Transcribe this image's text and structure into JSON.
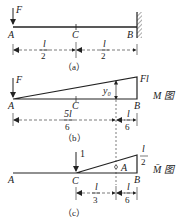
{
  "panel_a": {
    "force_label": "F",
    "points": [
      "A",
      "C",
      "B"
    ],
    "dims": [
      {
        "num": "l",
        "den": "2"
      },
      {
        "num": "l",
        "den": "2"
      }
    ],
    "caption": "（a）"
  },
  "panel_b": {
    "force_label": "F",
    "end_value": "Fl",
    "ordinate_label": "y₀",
    "diagram_label": "M 图",
    "points": [
      "A",
      "C",
      "B"
    ],
    "dims": [
      {
        "num": "5l",
        "den": "6"
      },
      {
        "num": "l",
        "den": "6"
      }
    ],
    "caption": "（b）"
  },
  "panel_c": {
    "unit_load": "1",
    "end_value": {
      "num": "l",
      "den": "2"
    },
    "area_label": "A",
    "diagram_label": "M̄ 图",
    "points": [
      "A",
      "C",
      "B"
    ],
    "dims": [
      {
        "num": "l",
        "den": "3"
      },
      {
        "num": "l",
        "den": "6"
      }
    ],
    "caption": "（c）"
  }
}
